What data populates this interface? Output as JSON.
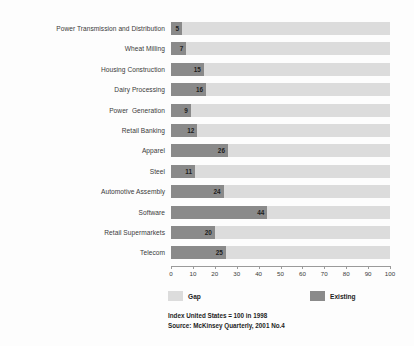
{
  "chart_data": {
    "type": "bar",
    "orientation": "horizontal",
    "stacked": true,
    "categories": [
      "Power Transmission and Distribution",
      "Wheat Milling",
      "Housing Construction",
      "Dairy Processing",
      "Power  Generation",
      "Retail Banking",
      "Apparel",
      "Steel",
      "Automotive Assembly",
      "Software",
      "Retail Supermarkets",
      "Telecom"
    ],
    "series": [
      {
        "name": "Existing",
        "color": "#8a8a8a",
        "values": [
          5,
          7,
          15,
          16,
          9,
          12,
          26,
          11,
          24,
          44,
          20,
          25
        ]
      },
      {
        "name": "Gap",
        "color": "#dcdcdc",
        "values": [
          95,
          93,
          85,
          84,
          91,
          88,
          74,
          89,
          76,
          56,
          80,
          75
        ]
      }
    ],
    "data_labels": [
      "5",
      "7",
      "15",
      "16",
      "9",
      "12",
      "26",
      "11",
      "24",
      "44",
      "20",
      "25"
    ],
    "title": "",
    "xlabel": "",
    "ylabel": "",
    "xlim": [
      0,
      100
    ],
    "xticks": [
      0,
      10,
      20,
      30,
      40,
      50,
      60,
      70,
      80,
      90,
      100
    ],
    "xtick_labels": [
      "0",
      "10",
      "20",
      "30",
      "40",
      "50",
      "60",
      "70",
      "80",
      "90",
      "100"
    ],
    "grid": false,
    "legend_position": "bottom"
  },
  "legend": {
    "gap_label": "Gap",
    "gap_color": "#dcdcdc",
    "existing_label": "Existing",
    "existing_color": "#8a8a8a"
  },
  "footnotes": {
    "index_note": "Index United States = 100 in 1998",
    "source_note": "Source: McKinsey Quarterly, 2001 No.4"
  }
}
